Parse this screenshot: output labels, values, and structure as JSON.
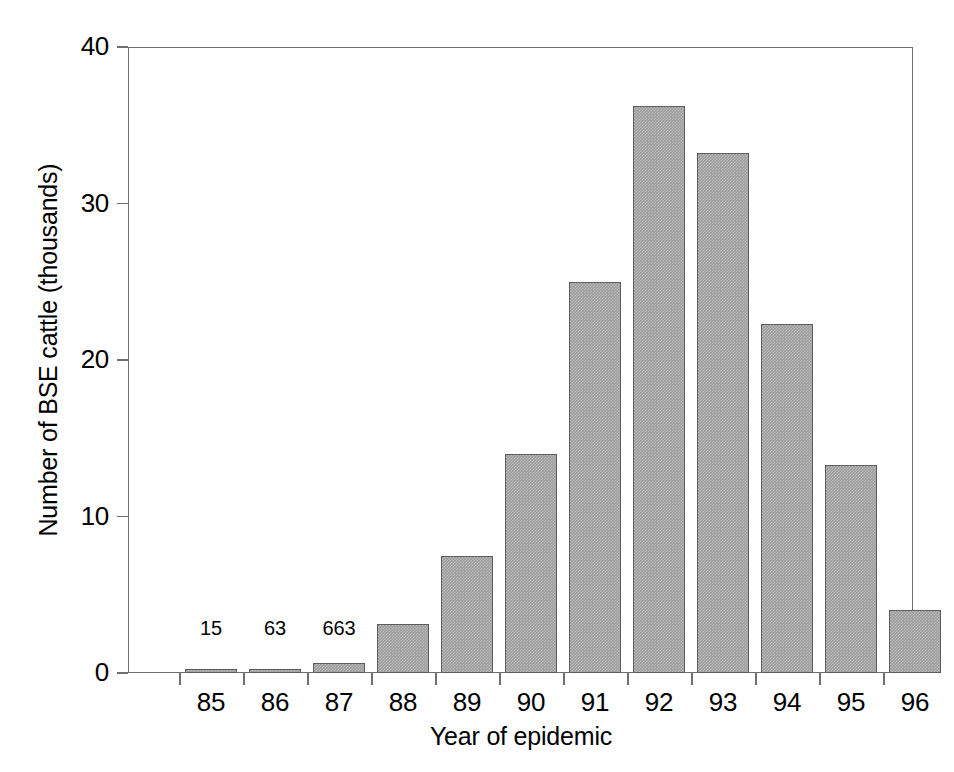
{
  "chart_data": {
    "type": "bar",
    "title": "",
    "subtitle": "",
    "xlabel": "Year of epidemic",
    "ylabel": "Number of BSE cattle (thousands)",
    "categories": [
      "85",
      "86",
      "87",
      "88",
      "89",
      "90",
      "91",
      "92",
      "93",
      "94",
      "95",
      "96"
    ],
    "values": [
      0.015,
      0.063,
      0.663,
      3.1,
      7.5,
      14.0,
      25.0,
      36.2,
      33.2,
      22.3,
      13.3,
      4.0
    ],
    "point_labels": [
      "15",
      "63",
      "663",
      "",
      "",
      "",
      "",
      "",
      "",
      "",
      "",
      ""
    ],
    "ylim": [
      0,
      40
    ],
    "yticks": [
      0,
      10,
      20,
      30,
      40
    ],
    "ytick_labels": [
      "0",
      "10",
      "20",
      "30",
      "40"
    ],
    "grid": false,
    "legend": false,
    "bar_color": "#9c9c9c",
    "bar_edge_color": "#5d5d5d",
    "axis_color": "#6f6f6f"
  }
}
